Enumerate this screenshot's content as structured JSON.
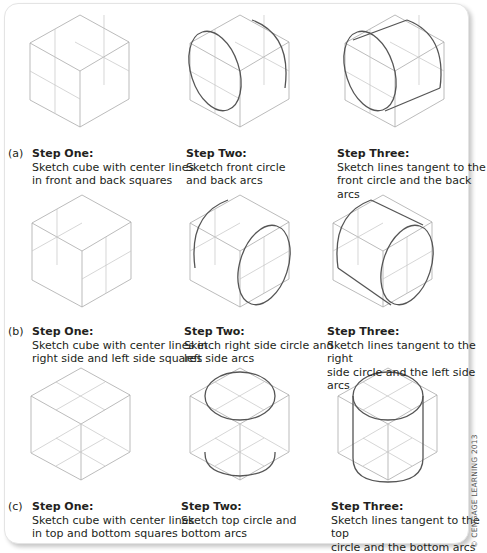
{
  "figure": {
    "rows": [
      {
        "label": "(a)",
        "steps": [
          {
            "title": "Step One:",
            "description": "Sketch cube with center lines\nin front and back squares"
          },
          {
            "title": "Step Two:",
            "description": "Sketch front circle\nand back arcs"
          },
          {
            "title": "Step Three:",
            "description": "Sketch lines tangent to the\nfront circle and the back arcs"
          }
        ]
      },
      {
        "label": "(b)",
        "steps": [
          {
            "title": "Step One:",
            "description": "Sketch cube with center lines in\nright side and left side squares"
          },
          {
            "title": "Step Two:",
            "description": "Sketch right side circle and\nleft side arcs"
          },
          {
            "title": "Step Three:",
            "description": "Sketch lines tangent to the right\nside circle and the left side arcs"
          }
        ]
      },
      {
        "label": "(c)",
        "steps": [
          {
            "title": "Step One:",
            "description": "Sketch cube with center lines\nin top and bottom squares"
          },
          {
            "title": "Step Two:",
            "description": "Sketch top circle and\nbottom arcs"
          },
          {
            "title": "Step Three:",
            "description": "Sketch lines tangent to the top\ncircle and the bottom arcs"
          }
        ]
      }
    ],
    "copyright": "© CENGAGE LEARNING 2013"
  },
  "colors": {
    "construction_line": "#a9a9a9",
    "ink_line": "#555555",
    "text": "#231f20"
  }
}
